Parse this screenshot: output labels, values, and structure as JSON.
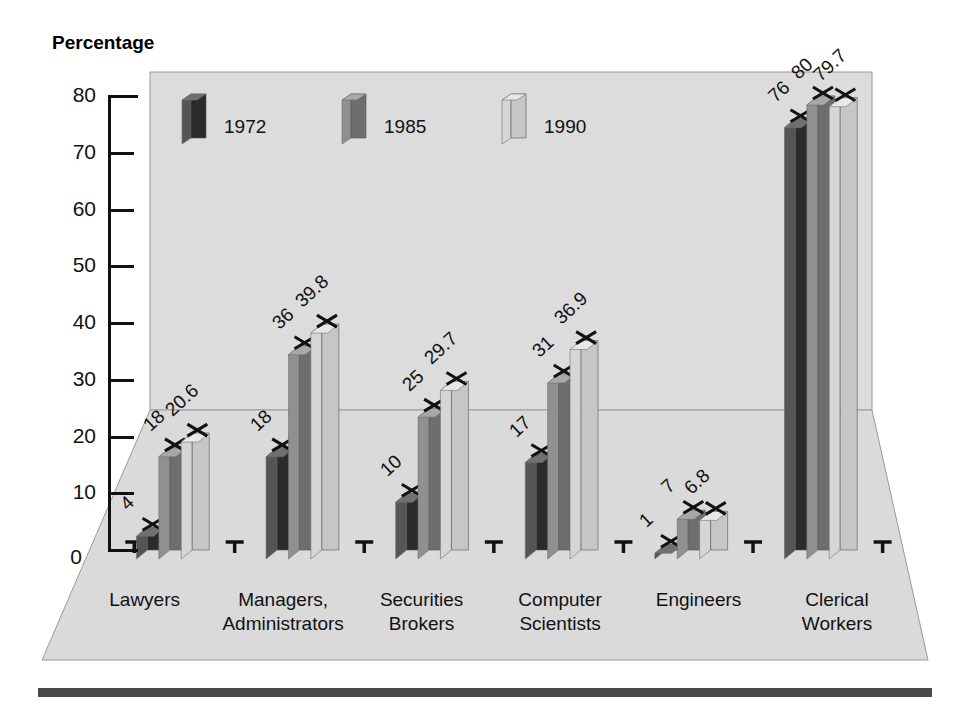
{
  "axis": {
    "title": "Percentage",
    "yticks": [
      0,
      10,
      20,
      30,
      40,
      50,
      60,
      70,
      80
    ]
  },
  "legend": {
    "items": [
      {
        "label": "1972",
        "color": "#3a3a3a"
      },
      {
        "label": "1985",
        "color": "#7a7a7a"
      },
      {
        "label": "1990",
        "color": "#c9c9c9"
      }
    ]
  },
  "colors": {
    "wall": "#dcdcdc",
    "floor": "#dadada",
    "outline": "#9a9a9a",
    "bar_1972_front": "#2b2b2b",
    "bar_1972_side": "#555555",
    "bar_1972_top": "#707070",
    "bar_1985_front": "#6e6e6e",
    "bar_1985_side": "#909090",
    "bar_1985_top": "#a8a8a8",
    "bar_1990_front": "#c6c6c6",
    "bar_1990_side": "#d6d6d6",
    "bar_1990_top": "#e8e8e8",
    "rule": "#4a4a4a"
  },
  "chart_data": {
    "type": "bar",
    "title": "",
    "xlabel": "",
    "ylabel": "Percentage",
    "ylim": [
      0,
      80
    ],
    "grid": false,
    "legend_position": "top-left-inside",
    "categories": [
      "Lawyers",
      "Managers, Administrators",
      "Securities Brokers",
      "Computer Scientists",
      "Engineers",
      "Clerical Workers"
    ],
    "category_lines": [
      [
        "Lawyers",
        ""
      ],
      [
        "Managers,",
        "Administrators"
      ],
      [
        "Securities",
        "Brokers"
      ],
      [
        "Computer",
        "Scientists"
      ],
      [
        "Engineers",
        ""
      ],
      [
        "Clerical",
        "Workers"
      ]
    ],
    "series": [
      {
        "name": "1972",
        "values": [
          4,
          18,
          10,
          17,
          1,
          76
        ],
        "labels": [
          "4",
          "18",
          "10",
          "17",
          "1",
          "76"
        ]
      },
      {
        "name": "1985",
        "values": [
          18,
          36,
          25,
          31,
          7,
          80
        ],
        "labels": [
          "18",
          "36",
          "25",
          "31",
          "7",
          "80"
        ]
      },
      {
        "name": "1990",
        "values": [
          20.6,
          39.8,
          29.7,
          36.9,
          6.8,
          79.7
        ],
        "labels": [
          "20.6",
          "39.8",
          "29.7",
          "36.9",
          "6.8",
          "79.7"
        ]
      }
    ]
  }
}
